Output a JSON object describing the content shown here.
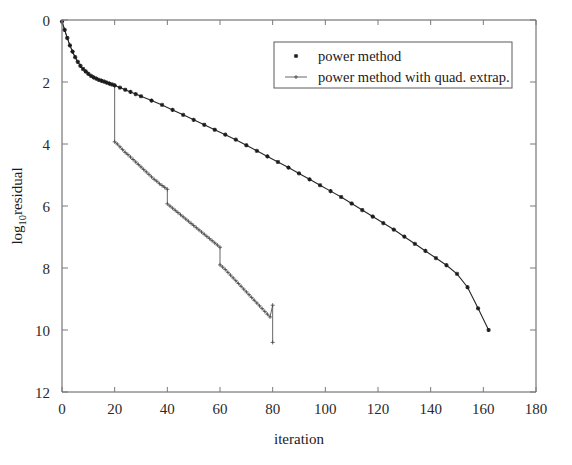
{
  "chart_data": {
    "type": "line",
    "title": "",
    "xlabel": "iteration",
    "ylabel": "log",
    "ylabel_subscript": "10",
    "ylabel_suffix": "residual",
    "xlim": [
      0,
      180
    ],
    "ylim": [
      12,
      0
    ],
    "xticks": [
      0,
      20,
      40,
      60,
      80,
      100,
      120,
      140,
      160,
      180
    ],
    "xticklabels": [
      "0",
      "20",
      "40",
      "60",
      "80",
      "100",
      "120",
      "140",
      "160",
      "180"
    ],
    "yticks": [
      0,
      2,
      4,
      6,
      8,
      10,
      12
    ],
    "yticklabels": [
      "0",
      "2",
      "4",
      "6",
      "8",
      "10",
      "12"
    ],
    "y_axis_note": "values are magnitudes of negative log10 residual (axis inverted, 0 at top)",
    "grid": false,
    "legend_position": "upper right",
    "series": [
      {
        "name": "power method",
        "marker": "star",
        "color": "#262626",
        "x": [
          0,
          1,
          2,
          3,
          4,
          5,
          6,
          7,
          8,
          9,
          10,
          11,
          12,
          13,
          14,
          15,
          16,
          17,
          18,
          19,
          20,
          22,
          24,
          26,
          28,
          30,
          34,
          38,
          42,
          46,
          50,
          54,
          58,
          62,
          66,
          70,
          74,
          78,
          82,
          86,
          90,
          94,
          98,
          102,
          106,
          110,
          114,
          118,
          122,
          126,
          130,
          134,
          138,
          142,
          146,
          150,
          154,
          158,
          162
        ],
        "y": [
          0.05,
          0.32,
          0.58,
          0.82,
          1.02,
          1.2,
          1.35,
          1.48,
          1.58,
          1.66,
          1.74,
          1.8,
          1.85,
          1.89,
          1.93,
          1.96,
          1.99,
          2.02,
          2.05,
          2.08,
          2.11,
          2.18,
          2.25,
          2.32,
          2.39,
          2.46,
          2.6,
          2.74,
          2.9,
          3.06,
          3.22,
          3.38,
          3.54,
          3.7,
          3.86,
          4.04,
          4.22,
          4.4,
          4.58,
          4.76,
          4.95,
          5.14,
          5.33,
          5.52,
          5.71,
          5.92,
          6.13,
          6.34,
          6.55,
          6.76,
          6.99,
          7.22,
          7.45,
          7.68,
          7.91,
          8.19,
          8.62,
          9.3,
          10.0
        ]
      },
      {
        "name": "power method with quad. extrap.",
        "marker": "plus",
        "color": "#555555",
        "x": [
          0,
          1,
          2,
          3,
          4,
          5,
          6,
          7,
          8,
          9,
          10,
          11,
          12,
          13,
          14,
          15,
          16,
          17,
          18,
          19,
          20,
          20,
          21,
          22,
          23,
          24,
          25,
          26,
          27,
          28,
          29,
          30,
          31,
          32,
          33,
          34,
          35,
          36,
          37,
          38,
          39,
          40,
          40,
          41,
          42,
          43,
          44,
          45,
          46,
          47,
          48,
          49,
          50,
          51,
          52,
          53,
          54,
          55,
          56,
          57,
          58,
          59,
          60,
          60,
          61,
          62,
          63,
          64,
          65,
          66,
          67,
          68,
          69,
          70,
          71,
          72,
          73,
          74,
          75,
          76,
          77,
          78,
          79,
          80,
          80
        ],
        "y": [
          0.05,
          0.32,
          0.58,
          0.82,
          1.02,
          1.2,
          1.35,
          1.48,
          1.58,
          1.66,
          1.74,
          1.8,
          1.85,
          1.89,
          1.93,
          1.96,
          1.99,
          2.02,
          2.05,
          2.08,
          2.11,
          3.93,
          4.0,
          4.09,
          4.18,
          4.27,
          4.34,
          4.42,
          4.5,
          4.58,
          4.66,
          4.74,
          4.82,
          4.9,
          4.98,
          5.06,
          5.14,
          5.2,
          5.28,
          5.34,
          5.4,
          5.46,
          5.93,
          6.0,
          6.07,
          6.14,
          6.21,
          6.28,
          6.35,
          6.42,
          6.49,
          6.56,
          6.63,
          6.7,
          6.77,
          6.84,
          6.91,
          6.98,
          7.05,
          7.12,
          7.19,
          7.26,
          7.33,
          7.9,
          7.97,
          8.05,
          8.14,
          8.23,
          8.32,
          8.41,
          8.5,
          8.59,
          8.68,
          8.77,
          8.86,
          8.95,
          9.04,
          9.13,
          9.22,
          9.31,
          9.4,
          9.49,
          9.58,
          9.2,
          10.4
        ]
      }
    ]
  },
  "legend": {
    "entries": [
      {
        "label": "power method",
        "marker": "star"
      },
      {
        "label": "power method with quad. extrap.",
        "marker": "plus"
      }
    ]
  }
}
